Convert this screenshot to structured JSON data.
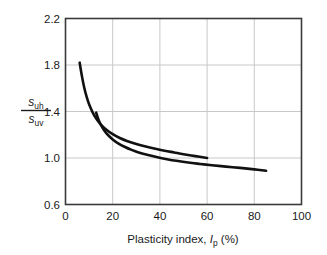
{
  "chart_data": {
    "type": "line",
    "title": "",
    "xlabel": "Plasticity index, Ip (%)",
    "ylabel": "suh/suv",
    "ylabel_numerator_base": "s",
    "ylabel_numerator_sub": "uh",
    "ylabel_denominator_base": "s",
    "ylabel_denominator_sub": "uv",
    "xlabel_text_before": "Plasticity index, ",
    "xlabel_symbol": "I",
    "xlabel_symbol_sub": "p",
    "xlabel_text_after": " (%)",
    "xlim": [
      0,
      100
    ],
    "ylim": [
      0.6,
      2.2
    ],
    "xticks": [
      0,
      20,
      40,
      60,
      80,
      100
    ],
    "yticks": [
      0.6,
      1.0,
      1.4,
      1.8,
      2.2
    ],
    "xtick_labels": [
      "0",
      "20",
      "40",
      "60",
      "80",
      "100"
    ],
    "ytick_labels": [
      "0.6",
      "1.0",
      "1.4",
      "1.8",
      "2.2"
    ],
    "grid": true,
    "legend": "none",
    "line_color": "#111111",
    "grid_color": "#c8c8c8",
    "frame_color": "#3a3a3a",
    "background": "#ffffff",
    "series": [
      {
        "name": "upper-curve",
        "points": [
          [
            6.0,
            1.82
          ],
          [
            7.0,
            1.7
          ],
          [
            8.0,
            1.6
          ],
          [
            9.0,
            1.523
          ],
          [
            10.0,
            1.462
          ],
          [
            11.5,
            1.393
          ],
          [
            13.0,
            1.34
          ],
          [
            15.0,
            1.288
          ],
          [
            17.5,
            1.24
          ],
          [
            20.0,
            1.205
          ],
          [
            23.0,
            1.172
          ],
          [
            26.0,
            1.147
          ],
          [
            30.0,
            1.12
          ],
          [
            34.0,
            1.098
          ],
          [
            38.0,
            1.08
          ],
          [
            42.0,
            1.063
          ],
          [
            46.0,
            1.048
          ],
          [
            50.0,
            1.033
          ],
          [
            55.0,
            1.016
          ],
          [
            60.0,
            1.0
          ]
        ]
      },
      {
        "name": "lower-curve",
        "points": [
          [
            13.0,
            1.39
          ],
          [
            14.0,
            1.33
          ],
          [
            15.0,
            1.285
          ],
          [
            16.5,
            1.235
          ],
          [
            18.0,
            1.198
          ],
          [
            20.0,
            1.16
          ],
          [
            22.5,
            1.124
          ],
          [
            25.0,
            1.097
          ],
          [
            28.0,
            1.07
          ],
          [
            31.0,
            1.048
          ],
          [
            35.0,
            1.025
          ],
          [
            39.0,
            1.006
          ],
          [
            43.0,
            0.99
          ],
          [
            47.0,
            0.976
          ],
          [
            52.0,
            0.961
          ],
          [
            57.0,
            0.949
          ],
          [
            62.0,
            0.938
          ],
          [
            68.0,
            0.926
          ],
          [
            74.0,
            0.915
          ],
          [
            80.0,
            0.902
          ],
          [
            85.0,
            0.89
          ]
        ]
      }
    ]
  }
}
